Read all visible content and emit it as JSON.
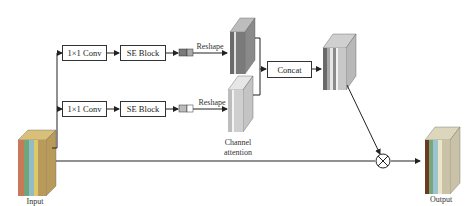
{
  "diagram": {
    "nodes": {
      "input": {
        "label": "Input"
      },
      "conv_top": {
        "label": "1×1 Conv"
      },
      "se_top": {
        "label": "SE Block"
      },
      "reshape_top": {
        "label": "Reshape"
      },
      "conv_bottom": {
        "label": "1×1 Conv"
      },
      "se_bottom": {
        "label": "SE Block"
      },
      "reshape_bottom": {
        "label": "Reshape"
      },
      "channel_attention": {
        "label_line1": "Channel",
        "label_line2": "attention"
      },
      "concat": {
        "label": "Concat"
      },
      "multiply": {
        "symbol": "⊗"
      },
      "output": {
        "label": "Output"
      }
    },
    "colors": {
      "input_layers": [
        "#c9785a",
        "#6fa77a",
        "#8fbcc8",
        "#e0c76a",
        "#b89a5a"
      ],
      "output_layers": [
        "#6b3a22",
        "#7aa67a",
        "#9cc4d0",
        "#ece6c8",
        "#c9c2a6"
      ],
      "dark_feature": "#7a7a7a",
      "light_feature": "#c8c8c8"
    }
  }
}
